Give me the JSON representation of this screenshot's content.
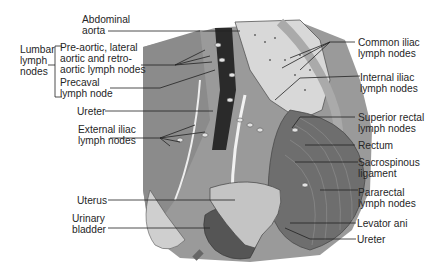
{
  "diagram": {
    "left_labels": {
      "abdominal_aorta": [
        "Abdominal",
        "aorta"
      ],
      "lumbar_lymph_nodes": [
        "Lumbar",
        "lymph",
        "nodes"
      ],
      "preaortic": [
        "Pre-aortic, lateral",
        "aortic and retro-",
        "aortic lymph nodes"
      ],
      "precaval": [
        "Precaval",
        "lymph node"
      ],
      "ureter": "Ureter",
      "external_iliac": [
        "External iliac",
        "lymph nodes"
      ],
      "uterus": "Uterus",
      "urinary_bladder": [
        "Urinary",
        "bladder"
      ]
    },
    "right_labels": {
      "common_iliac": [
        "Common iliac",
        "lymph nodes"
      ],
      "internal_iliac": [
        "Internal iliac",
        "lymph nodes"
      ],
      "superior_rectal": [
        "Superior rectal",
        "lymph nodes"
      ],
      "rectum": "Rectum",
      "sacrospinous": [
        "Sacrospinous",
        "ligament"
      ],
      "pararectal": [
        "Pararectal",
        "lymph nodes"
      ],
      "levator_ani": "Levator ani",
      "ureter": "Ureter"
    }
  }
}
